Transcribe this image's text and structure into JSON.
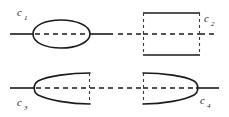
{
  "figure": {
    "background_color": "#ffffff",
    "stroke_color": "#1a1a1a",
    "width": 229,
    "height": 117
  },
  "panels": [
    {
      "id": "panel-c1",
      "label_base": "c",
      "label_subscript": "1",
      "label_full": "c1",
      "label_position": "top-left",
      "shape": "ellipse",
      "description": "Ellipse (lens) centred on a solid horizontal line; the portion of the line inside the ellipse is dashed.",
      "axis_style_inside": "dashed",
      "axis_style_outside": "solid"
    },
    {
      "id": "panel-c2",
      "label_base": "c",
      "label_subscript": "2",
      "label_full": "c2",
      "label_position": "top-right",
      "shape": "rectangle",
      "description": "Rectangle with solid top and bottom edges and dashed left and right edges; a dashed horizontal line crosses the centre and extends past both sides.",
      "axis_style_inside": "dashed",
      "axis_style_outside": "dashed"
    },
    {
      "id": "panel-c3",
      "label_base": "c",
      "label_subscript": "3",
      "label_full": "c3",
      "label_position": "bottom-left",
      "shape": "d-shape-opening-right",
      "description": "Parabolic D shape with a solid rounded nose on the left and a dashed vertical closing edge on the right; solid horizontal line enters from the left and the interior line is dashed.",
      "axis_style_inside": "dashed",
      "axis_style_outside": "solid-left-dashed-right"
    },
    {
      "id": "panel-c4",
      "label_base": "c",
      "label_subscript": "4",
      "label_full": "c4",
      "label_position": "bottom-right",
      "shape": "d-shape-opening-left",
      "description": "Mirrored parabolic D shape with a dashed vertical edge on the left and a solid rounded nose on the right; dashed horizontal line enters from the left and a solid line exits to the right.",
      "axis_style_inside": "dashed",
      "axis_style_outside": "dashed-left-solid-right"
    }
  ]
}
